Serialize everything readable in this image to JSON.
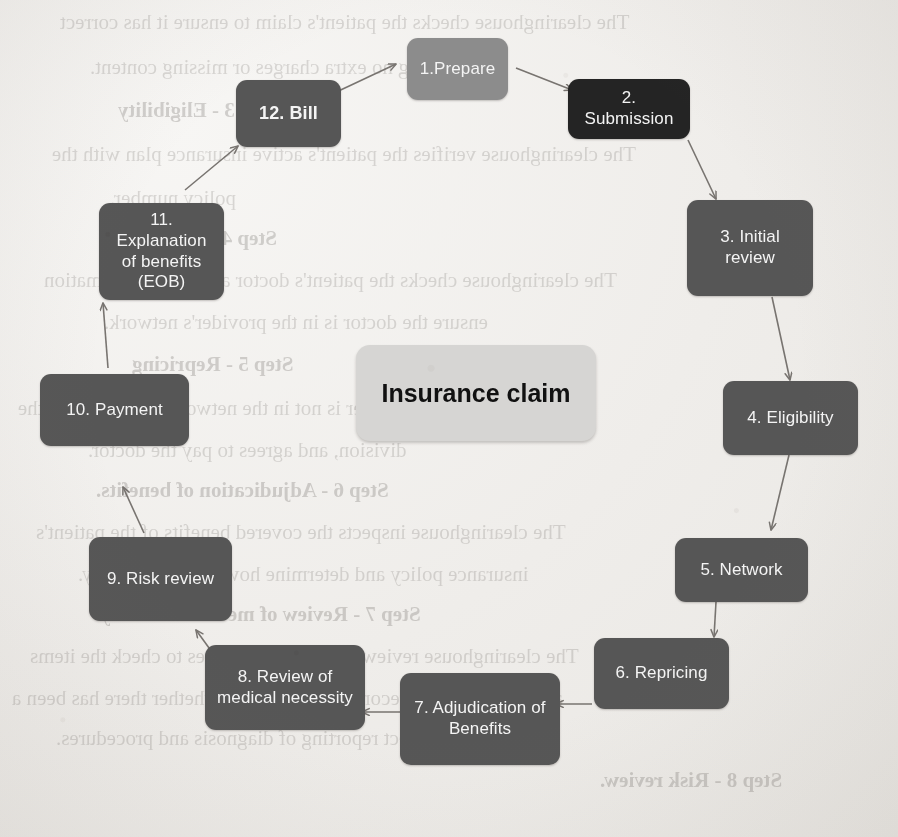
{
  "diagram": {
    "title": "Insurance claim",
    "center": {
      "label": "Insurance claim"
    },
    "colors": {
      "node_dark": "#565656",
      "node_darkest": "#242424",
      "node_light": "#8c8c8c",
      "center_fill": "#d6d5d3",
      "node_text": "#f4f4f4",
      "center_text": "#111111",
      "arrow": "#6e6a66",
      "page_background": "#efedea"
    },
    "nodes": [
      {
        "id": "step-1",
        "label": "1.Prepare",
        "shade": "light"
      },
      {
        "id": "step-2",
        "label": "2. Submission",
        "shade": "darkest"
      },
      {
        "id": "step-3",
        "label": "3. Initial review",
        "shade": "dark"
      },
      {
        "id": "step-4",
        "label": "4. Eligibility",
        "shade": "dark"
      },
      {
        "id": "step-5",
        "label": "5. Network",
        "shade": "dark"
      },
      {
        "id": "step-6",
        "label": "6. Repricing",
        "shade": "dark"
      },
      {
        "id": "step-7",
        "label": "7. Adjudication of Benefits",
        "shade": "dark"
      },
      {
        "id": "step-8",
        "label": "8. Review of medical necessity",
        "shade": "dark"
      },
      {
        "id": "step-9",
        "label": "9. Risk review",
        "shade": "dark"
      },
      {
        "id": "step-10",
        "label": "10. Payment",
        "shade": "dark"
      },
      {
        "id": "step-11",
        "label": "11. Explanation of benefits (EOB)",
        "shade": "dark"
      },
      {
        "id": "step-12",
        "label": "12. Bill",
        "shade": "dark"
      }
    ],
    "flow_order": [
      "step-1",
      "step-2",
      "step-3",
      "step-4",
      "step-5",
      "step-6",
      "step-7",
      "step-8",
      "step-9",
      "step-10",
      "step-11",
      "step-12",
      "step-1"
    ]
  },
  "background_text": {
    "note": "faint mirrored bleed-through from the reverse side of the scanned page",
    "lines": [
      "The clearinghouse checks the patient's claim to ensure it has correct",
      "including no extra charges or missing content.",
      "Step 3 - Eligibility",
      "The clearinghouse verifies the patient's active insurance plan with the",
      "policy number.",
      "Step 4 - Network",
      "The clearinghouse checks the patient's doctor and clinic information",
      "ensure the doctor is in the provider's network.",
      "Step 5 - Repricing",
      "If the provider is not in the network, but negotiate the",
      "division, and agrees to pay the doctor.",
      "Step 6 - Adjudication of benefits.",
      "The clearinghouse inspects the covered benefits of the patient's",
      "insurance policy and determine how much it will pay.",
      "Step 7 - Review of medical necessity.",
      "The clearinghouse reviews the patient services to check the items",
      "as per the doctor's recommendation, and whether there has been a",
      "correct reporting of diagnosis and procedures.",
      "Step 8 - Risk review.",
      "The clearinghouse assesses the claim risk with an insurance panel."
    ]
  }
}
